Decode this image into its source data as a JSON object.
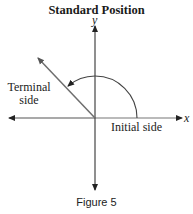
{
  "title": "Standard Position",
  "axes": {
    "x_label": "x",
    "y_label": "y"
  },
  "labels": {
    "terminal_side_line1": "Terminal",
    "terminal_side_line2": "side",
    "initial_side": "Initial side"
  },
  "caption": "Figure 5",
  "colors": {
    "axis": "#222222",
    "terminal_side": "#6e6e6e",
    "arc": "#444444",
    "text": "#222222"
  }
}
